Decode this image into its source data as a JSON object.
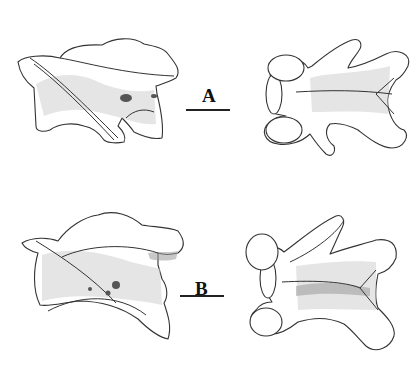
{
  "figure": {
    "type": "scientific-illustration",
    "panels": [
      {
        "label": "A",
        "views": [
          "lateral view",
          "dorsal view"
        ],
        "scale_bar": true
      },
      {
        "label": "B",
        "views": [
          "lateral view",
          "dorsal view"
        ],
        "scale_bar": true
      }
    ],
    "colors": {
      "ink": "#222222",
      "background": "#ffffff"
    }
  }
}
